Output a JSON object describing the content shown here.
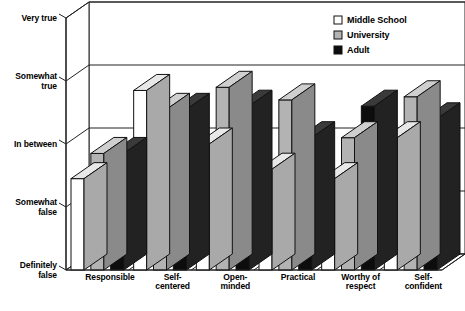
{
  "chart_data": {
    "type": "bar",
    "subtype": "3d-grouped-column",
    "title": "",
    "xlabel": "",
    "ylabel": "",
    "categories": [
      "Responsible",
      "Self-\ncentered",
      "Open-\nminded",
      "Practical",
      "Worthy of\nrespect",
      "Self-\nconfident"
    ],
    "series": [
      {
        "name": "Middle School",
        "color": "#ffffff",
        "values": [
          2.45,
          3.85,
          3.0,
          2.6,
          2.45,
          3.1
        ]
      },
      {
        "name": "University",
        "color": "#b3b3b3",
        "values": [
          2.85,
          3.55,
          3.9,
          3.7,
          3.1,
          3.75
        ]
      },
      {
        "name": "Adult",
        "color": "#0d0d0d",
        "values": [
          2.85,
          3.55,
          3.6,
          3.1,
          3.6,
          3.4
        ]
      }
    ],
    "ytick_labels": [
      "Very true",
      "Somewhat\ntrue",
      "In between",
      "Somewhat\nfalse",
      "Definitely\nfalse"
    ],
    "ytick_values": [
      5,
      4,
      3,
      2,
      1
    ],
    "ylim": [
      1,
      5
    ],
    "grid": true,
    "legend_position": "top-right",
    "legend_entries": [
      {
        "label": "Middle School",
        "swatch": "#ffffff"
      },
      {
        "label": "University",
        "swatch": "#b3b3b3"
      },
      {
        "label": "Adult",
        "swatch": "#0d0d0d"
      }
    ]
  }
}
